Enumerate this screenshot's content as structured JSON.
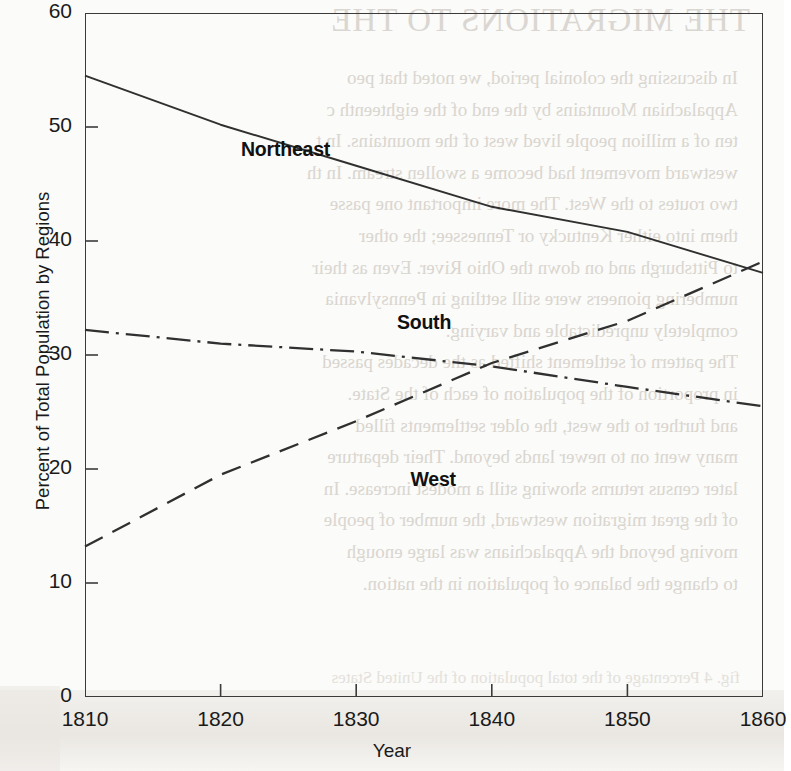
{
  "chart_data": {
    "type": "line",
    "title": "",
    "xlabel": "Year",
    "ylabel": "Percent of Total Population by Regions",
    "xlim": [
      1810,
      1860
    ],
    "ylim": [
      0,
      60
    ],
    "xticks": [
      "1810",
      "1820",
      "1830",
      "1840",
      "1850",
      "1860"
    ],
    "yticks": [
      "0",
      "10",
      "20",
      "30",
      "40",
      "50",
      "60"
    ],
    "grid": false,
    "legend_position": "inline-labels",
    "x": [
      1810,
      1820,
      1830,
      1840,
      1850,
      1860
    ],
    "series": [
      {
        "name": "Northeast",
        "line_style": "solid",
        "values": [
          54.5,
          50.2,
          46.6,
          43.0,
          40.8,
          37.2
        ],
        "label_x": 1821.5,
        "label_y": 48.0
      },
      {
        "name": "South",
        "line_style": "dash-dot",
        "values": [
          32.2,
          31.0,
          30.3,
          29.0,
          27.2,
          25.5
        ],
        "label_x": 1833.0,
        "label_y": 32.8
      },
      {
        "name": "West",
        "line_style": "dashed",
        "values": [
          13.2,
          19.5,
          24.2,
          29.3,
          33.0,
          38.2
        ],
        "label_x": 1834.0,
        "label_y": 19.0
      }
    ],
    "annotations": [
      "Northeast and West series cross near 1858",
      "South and West series cross near 1838 at about 29 percent"
    ]
  },
  "axis": {
    "y_title": "Percent of Total Population by Regions",
    "x_title": "Year",
    "y_tick_labels": [
      "60",
      "50",
      "40",
      "30",
      "20",
      "10",
      "0"
    ],
    "x_tick_labels": [
      "1810",
      "1820",
      "1830",
      "1840",
      "1850",
      "1860"
    ]
  },
  "series_labels": {
    "northeast": "Northeast",
    "south": "South",
    "west": "West"
  },
  "colors": {
    "line": "#303030",
    "axis": "#3b3b3b",
    "text": "#1a1a1a",
    "page": "#fbfbf9",
    "bleed_text": "#d2cdc6"
  },
  "page_bleed": {
    "title": "THE MIGRATIONS TO THE",
    "body": "In discussing the colonial period, we noted that peo\nAppalachian Mountains by the end of the eighteenth c\nten of a million people lived west of the mountains. In t\nwestward movement had become a swollen stream. In th\ntwo routes to the West. The more important one passe\nthem into either Kentucky or Tennessee; the other \nto Pittsburgh and on down the Ohio River. Even as their\nnumbering pioneers were still settling in Pennsylvania\ncompletely unpredictable and varying.\nThe pattern of settlement shifted as the decades passed\nin proportion of the population of each of the State.\nand further to the west, the older settlements filled\nmany went on to newer lands beyond. Their departure\nlater census returns showing still a modest increase. In\nof the great migration westward, the number of people\nmoving beyond the Appalachians was large enough\nto change the balance of population in the nation.",
    "footer": "fig. 4 Percentage of the total population of the United States"
  }
}
